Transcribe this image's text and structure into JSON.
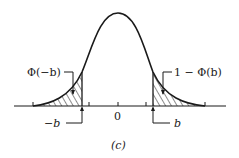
{
  "figure": {
    "caption": "(c)",
    "distribution": "standard normal density",
    "axis": {
      "center_label": "0",
      "left_cut_label": "−b",
      "right_cut_label": "b"
    },
    "regions": [
      {
        "name": "left-tail",
        "label": "Φ(−b)",
        "shaded": true,
        "pattern": "diagonal-hatch"
      },
      {
        "name": "right-tail",
        "label": "1 − Φ(b)",
        "shaded": true,
        "pattern": "diagonal-hatch"
      }
    ],
    "colors": {
      "line": "#1a1a1a",
      "background": "#ffffff"
    }
  }
}
